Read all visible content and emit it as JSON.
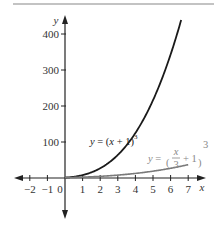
{
  "chart_data": {
    "type": "line",
    "title": "",
    "xlabel": "x",
    "ylabel": "y",
    "xlim": [
      -2.6,
      7.6
    ],
    "ylim": [
      -60,
      420
    ],
    "grid": false,
    "x_ticks": [
      "-2",
      "-1",
      "0",
      "1",
      "2",
      "3",
      "4",
      "5",
      "6",
      "7"
    ],
    "y_ticks": [
      "100",
      "200",
      "300",
      "400"
    ],
    "series": [
      {
        "name": "y = (x + 1)^3",
        "label_main": "y = (x + 1)",
        "label_exp": "3",
        "color": "#1a1a1a",
        "x": [
          0,
          1,
          2,
          3,
          4,
          5,
          6,
          6.6
        ],
        "values": [
          1,
          8,
          27,
          64,
          125,
          216,
          343,
          438
        ]
      },
      {
        "name": "y = (x/3 + 1)^3",
        "label_prefix": "y =",
        "label_num": "x",
        "label_den": "3",
        "label_suffix": "+ 1",
        "label_exp": "3",
        "color": "#777777",
        "x": [
          0,
          1,
          2,
          3,
          4,
          5,
          6,
          7
        ],
        "values": [
          1,
          2.37,
          4.63,
          8,
          12.7,
          18.96,
          27,
          37.04
        ]
      }
    ]
  },
  "colors": {
    "axis": "#222222",
    "top_rule": "#777777",
    "curve1": "#1a1a1a",
    "curve2": "#7a7a7a",
    "label2": "#888888"
  }
}
